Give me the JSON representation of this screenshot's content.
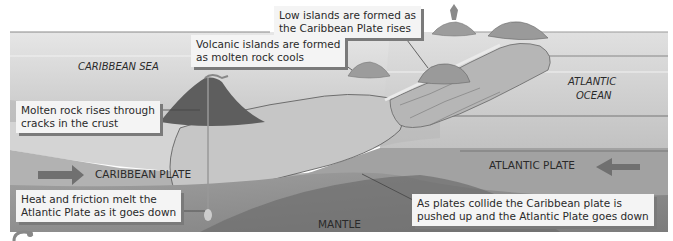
{
  "diagram": {
    "regions": {
      "caribbean_sea": "CARIBBEAN SEA",
      "atlantic_ocean_line1": "ATLANTIC",
      "atlantic_ocean_line2": "OCEAN",
      "caribbean_plate": "CARIBBEAN PLATE",
      "atlantic_plate": "ATLANTIC PLATE",
      "mantle": "MANTLE"
    },
    "callouts": {
      "low_islands": {
        "line1": "Low islands are formed as",
        "line2": "the Caribbean Plate rises"
      },
      "volcanic_islands": {
        "line1": "Volcanic islands are formed",
        "line2": "as molten rock cools"
      },
      "molten_rock": {
        "line1": "Molten rock rises through",
        "line2": "cracks in the crust"
      },
      "heat_friction": {
        "line1": "Heat and friction melt the",
        "line2": "Atlantic Plate as it goes down"
      },
      "plates_collide": {
        "line1": "As plates collide the Caribbean plate is",
        "line2": "pushed up and the Atlantic Plate goes down"
      }
    },
    "arrows": {
      "caribbean_plate_direction": "right",
      "atlantic_plate_direction": "left"
    },
    "colors": {
      "sky": "#ffffff",
      "sea_top": "#d8d8d8",
      "sea": "#c4c4c4",
      "crust": "#b0b0b0",
      "plate_caribbean": "#a8a8a8",
      "plate_atlantic": "#9a9a9a",
      "mantle": "#8a8a8a",
      "volcano": "#5e5e5e",
      "arrow": "#707070",
      "island": "#9c9c9c",
      "callout_bg": "#f4f4f4",
      "callout_shadow": "#7a7a7a"
    }
  }
}
